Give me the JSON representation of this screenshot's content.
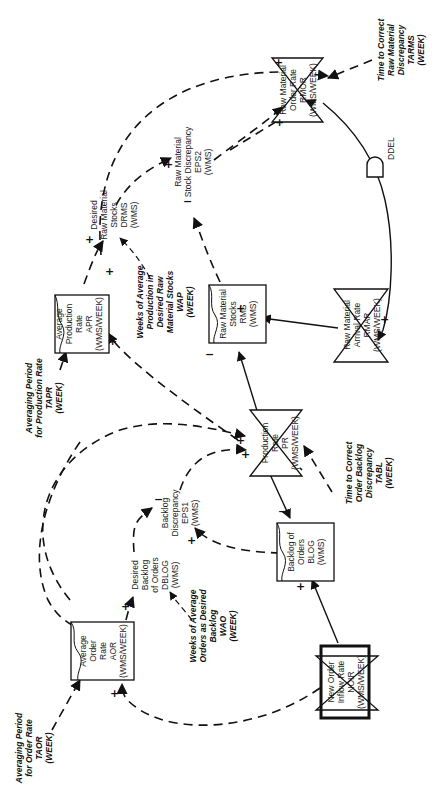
{
  "diagram": {
    "orientation": "rotated-90-ccw",
    "stocks": [
      {
        "id": "aor",
        "lines": [
          "Average",
          "Order",
          "Rate",
          "AOR",
          "(WMS/WEEK)"
        ]
      },
      {
        "id": "apr",
        "lines": [
          "Average",
          "Production",
          "Rate",
          "APR",
          "(WMS/WEEK)"
        ]
      },
      {
        "id": "rms",
        "lines": [
          "Raw Material",
          "Stocks",
          "RMS",
          "(WMS)"
        ]
      },
      {
        "id": "blog",
        "lines": [
          "Backlog of",
          "Orders",
          "BLOG",
          "(WMS)"
        ]
      }
    ],
    "rates": [
      {
        "id": "rmor",
        "lines": [
          "Raw Material",
          "Order Rate",
          "RMOR",
          "(WMS/WEEK)"
        ]
      },
      {
        "id": "rmar",
        "lines": [
          "Raw Material",
          "Arrival Rate",
          "RMAR",
          "(WMS/WEEK)"
        ]
      },
      {
        "id": "pr",
        "lines": [
          "Production",
          "Rate",
          "PR",
          "(WMS/WEEK)"
        ]
      },
      {
        "id": "noir",
        "lines": [
          "New Order",
          "Inflow Rate",
          "NOIR",
          "(WMS/WEEK)"
        ]
      }
    ],
    "auxiliaries": [
      {
        "id": "drms",
        "lines": [
          "Desired",
          "Raw Material",
          "Stocks",
          "DRMS",
          "(WMS)"
        ]
      },
      {
        "id": "eps2",
        "lines": [
          "Raw Material",
          "Stock Discrepancy",
          "EPS2",
          "(WMS)"
        ]
      },
      {
        "id": "dblog",
        "lines": [
          "Desired",
          "Backlog",
          "of Orders",
          "DBLOG",
          "(WMS)"
        ]
      },
      {
        "id": "eps1",
        "lines": [
          "Backlog",
          "Discrepancy",
          "EPS1",
          "(WMS)"
        ]
      }
    ],
    "constants": [
      {
        "id": "tarms",
        "lines": [
          "Time to Correct",
          "Raw Material",
          "Discrepancy",
          "TARMS",
          "(WEEK)"
        ]
      },
      {
        "id": "tapr",
        "lines": [
          "Averaging Period",
          "for Production Rate",
          "TAPR",
          "(WEEK)"
        ]
      },
      {
        "id": "wap",
        "lines": [
          "Weeks of Average",
          "Production in",
          "Desired Raw",
          "Material Stocks",
          "WAP",
          "(WEEK)"
        ]
      },
      {
        "id": "tabl",
        "lines": [
          "Time to Correct",
          "Order Backlog",
          "Discrepancy",
          "TABL",
          "(WEEK)"
        ]
      },
      {
        "id": "wao",
        "lines": [
          "Weeks of Average",
          "Orders as Desired",
          "Backlog",
          "WAO",
          "(WEEK)"
        ]
      },
      {
        "id": "taor",
        "lines": [
          "Averaging Period",
          "for Order Rate",
          "TAOR",
          "(WEEK)"
        ]
      }
    ],
    "delay": {
      "label": "DDEL"
    },
    "signs": {
      "plus": "+",
      "minus": "−"
    }
  }
}
